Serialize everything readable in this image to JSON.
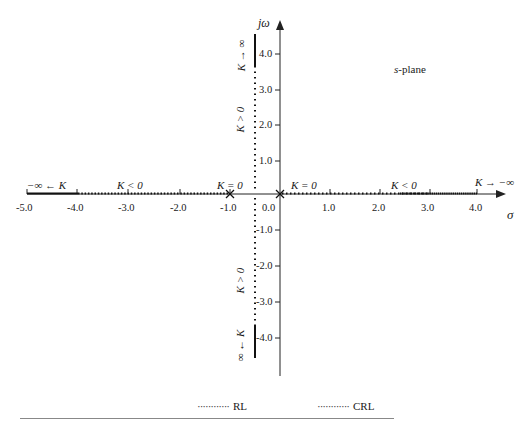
{
  "diagram": {
    "title": "s-plane",
    "axes": {
      "x_label": "σ",
      "y_label": "jω",
      "x_ticks": [
        "-5.0",
        "-4.0",
        "-3.0",
        "-2.0",
        "-1.0",
        "0.0",
        "1.0",
        "2.0",
        "3.0",
        "4.0"
      ],
      "y_ticks": [
        "4.0",
        "3.0",
        "2.0",
        "1.0",
        "-1.0",
        "-2.0",
        "-3.0",
        "-4.0"
      ]
    },
    "poles": [
      {
        "sigma": -1.0,
        "omega": 0,
        "label": "K = 0"
      },
      {
        "sigma": 0.0,
        "omega": 0,
        "label": "K = 0"
      }
    ],
    "annotations": {
      "left_end": "−∞ ← K",
      "left_region": "K < 0",
      "left_pole": "K = 0",
      "right_pole": "K = 0",
      "right_region": "K < 0",
      "right_end": "K → −∞",
      "upper_branch": "K > 0",
      "upper_end": "K → ∞",
      "lower_branch": "K > 0",
      "lower_end": "∞ ← K"
    },
    "legend": [
      {
        "label": "RL",
        "style": "dotted"
      },
      {
        "label": "CRL",
        "style": "dotted"
      }
    ]
  }
}
